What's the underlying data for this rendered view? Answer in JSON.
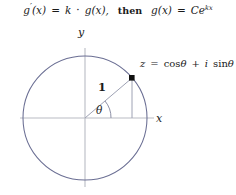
{
  "equation": {
    "lhs_fn": "g",
    "lhs_prime": "′",
    "lhs_arg": "(x)",
    "equals": "=",
    "rhs_k": "k",
    "dot": "·",
    "rhs_fn": "g",
    "rhs_arg": "(x),",
    "then": "then",
    "sol_fn": "g",
    "sol_arg": "(x)",
    "sol_equals": "=",
    "sol_const": "C",
    "sol_base": "e",
    "sol_exponent": "kx",
    "full_text": "g′(x) = k · g(x),   then   g(x) = Ce^{kx}"
  },
  "diagram": {
    "type": "unit-circle",
    "axis_labels": {
      "x": "x",
      "y": "y"
    },
    "radius_label": "1",
    "angle_label": "θ",
    "point_label": "z = cos θ + i sin θ",
    "point_label_parts": {
      "z": "z",
      "equals": "=",
      "cos": "cos",
      "theta1": "θ",
      "plus": "+",
      "i": "i",
      "sin": "sin",
      "theta2": "θ"
    },
    "geometry": {
      "center_x": 85,
      "center_y": 118,
      "radius": 62,
      "angle_degrees": 40,
      "point_x": 132,
      "point_y": 78
    },
    "colors": {
      "circle_stroke": "#6a6e93",
      "axis_stroke": "#b9bcc4",
      "radius_stroke": "#9ea2b4",
      "drop_line_stroke": "#9ea2b4",
      "arc_stroke": "#8d90a6",
      "point_fill": "#111111",
      "text": "#1a1a1a",
      "background": "#ffffff"
    }
  }
}
